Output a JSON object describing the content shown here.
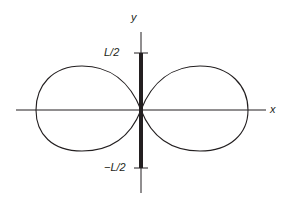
{
  "diagram": {
    "axes": {
      "x_label": "x",
      "y_label": "y"
    },
    "ticks": {
      "top": "L/2",
      "bottom": "−L/2"
    },
    "curve": "figure-eight radiation pattern (two lobes along x-axis)",
    "rod": "thick segment along y-axis from -L/2 to L/2",
    "colors": {
      "stroke": "#231f20",
      "background": "#ffffff"
    }
  }
}
